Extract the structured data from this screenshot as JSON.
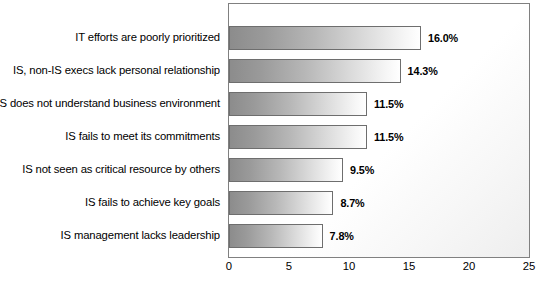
{
  "chart_data": {
    "type": "bar",
    "orientation": "horizontal",
    "title": "",
    "subtitle": "",
    "xlabel": "",
    "ylabel": "",
    "xlim": [
      0,
      25
    ],
    "xticks": [
      0,
      5,
      10,
      15,
      20,
      25
    ],
    "xtick_labels": [
      "0",
      "5",
      "10",
      "15",
      "20",
      "25"
    ],
    "grid": false,
    "legend": false,
    "legend_position": "none",
    "categories": [
      "IT efforts are poorly prioritized",
      "IS, non-IS execs lack personal relationship",
      "IS does not understand business environment",
      "IS fails to meet its commitments",
      "IS not seen as critical resource by others",
      "IS fails to achieve key goals",
      "IS management lacks leadership"
    ],
    "values": [
      16.0,
      14.3,
      11.5,
      11.5,
      9.5,
      8.7,
      7.8
    ],
    "value_labels": [
      "16.0%",
      "14.3%",
      "11.5%",
      "11.5%",
      "9.5%",
      "8.7%",
      "7.8%"
    ],
    "colors": {
      "bar_gradient_start": "#8c8c8c",
      "bar_gradient_end": "#ffffff",
      "bar_border": "#6e6e6e",
      "plot_border": "#808080",
      "plot_background": "#ffffff",
      "text": "#000000"
    }
  }
}
